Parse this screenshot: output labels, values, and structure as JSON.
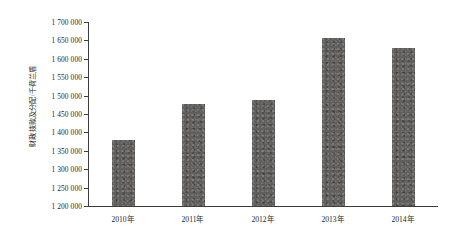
{
  "chart_data": {
    "type": "bar",
    "title": "",
    "xlabel": "",
    "ylabel": "财政拨款及分配/千荷兰盾",
    "categories": [
      "2010年",
      "2011年",
      "2012年",
      "2013年",
      "2014年"
    ],
    "values": [
      1380000,
      1478000,
      1487000,
      1657000,
      1630000
    ],
    "ylim": [
      1200000,
      1700000
    ],
    "ytick_step": 50000,
    "ytick_labels": [
      "1 700 000",
      "1 650 000",
      "1 600 000",
      "1 550 000",
      "1 500 000",
      "1 450 000",
      "1 400 000",
      "1 350 000",
      "1 300 000",
      "1 250 000",
      "1 200 000"
    ],
    "ytick_values": [
      1700000,
      1650000,
      1600000,
      1550000,
      1500000,
      1450000,
      1400000,
      1350000,
      1300000,
      1250000,
      1200000
    ],
    "grid": false,
    "legend": null,
    "series_color": "#605f5d",
    "axis_color": "#3d3d3d",
    "background": "#ffffff"
  }
}
